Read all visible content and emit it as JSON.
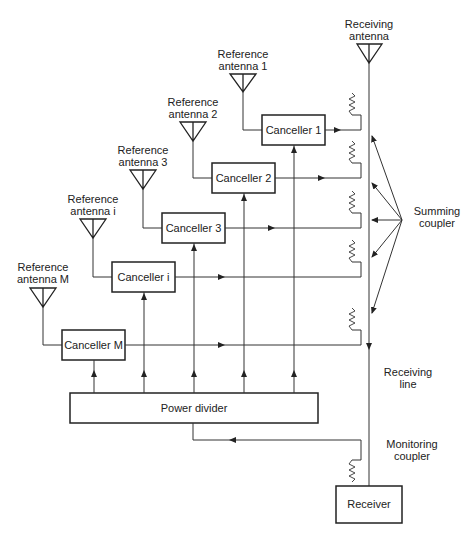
{
  "diagram": {
    "receiving_antenna": [
      "Receiving",
      "antenna"
    ],
    "reference_antennas": [
      {
        "lines": [
          "Reference",
          "antenna 1"
        ]
      },
      {
        "lines": [
          "Reference",
          "antenna 2"
        ]
      },
      {
        "lines": [
          "Reference",
          "antenna 3"
        ]
      },
      {
        "lines": [
          "Reference",
          "antenna i"
        ]
      },
      {
        "lines": [
          "Reference",
          "antenna M"
        ]
      }
    ],
    "cancellers": [
      "Canceller 1",
      "Canceller 2",
      "Canceller 3",
      "Canceller i",
      "Canceller M"
    ],
    "power_divider": "Power divider",
    "receiver": "Receiver",
    "summing_coupler": [
      "Summing",
      "coupler"
    ],
    "receiving_line": [
      "Receiving",
      "line"
    ],
    "monitoring_coupler": [
      "Monitoring",
      "coupler"
    ]
  }
}
